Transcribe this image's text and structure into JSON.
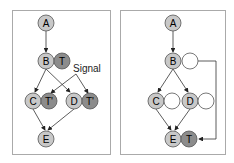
{
  "left_panel": {
    "nodes": [
      {
        "id": "A",
        "label": "A"
      },
      {
        "id": "B",
        "label": "B"
      },
      {
        "id": "T",
        "label": "T"
      },
      {
        "id": "C",
        "label": "C"
      },
      {
        "id": "T1",
        "label": "T'"
      },
      {
        "id": "D",
        "label": "D"
      },
      {
        "id": "T2",
        "label": "T'"
      },
      {
        "id": "E",
        "label": "E"
      }
    ],
    "annotation": "Signal"
  },
  "right_panel": {
    "nodes": [
      {
        "id": "A",
        "label": "A"
      },
      {
        "id": "B",
        "label": "B"
      },
      {
        "id": "C",
        "label": "C"
      },
      {
        "id": "D",
        "label": "D"
      },
      {
        "id": "E",
        "label": "E"
      },
      {
        "id": "T",
        "label": "T"
      }
    ]
  },
  "colors": {
    "node_fill": "#c8c8c8",
    "thread_fill": "#8c8c8c",
    "empty_fill": "#ffffff",
    "stroke": "#555555",
    "border": "#aaaaaa"
  }
}
